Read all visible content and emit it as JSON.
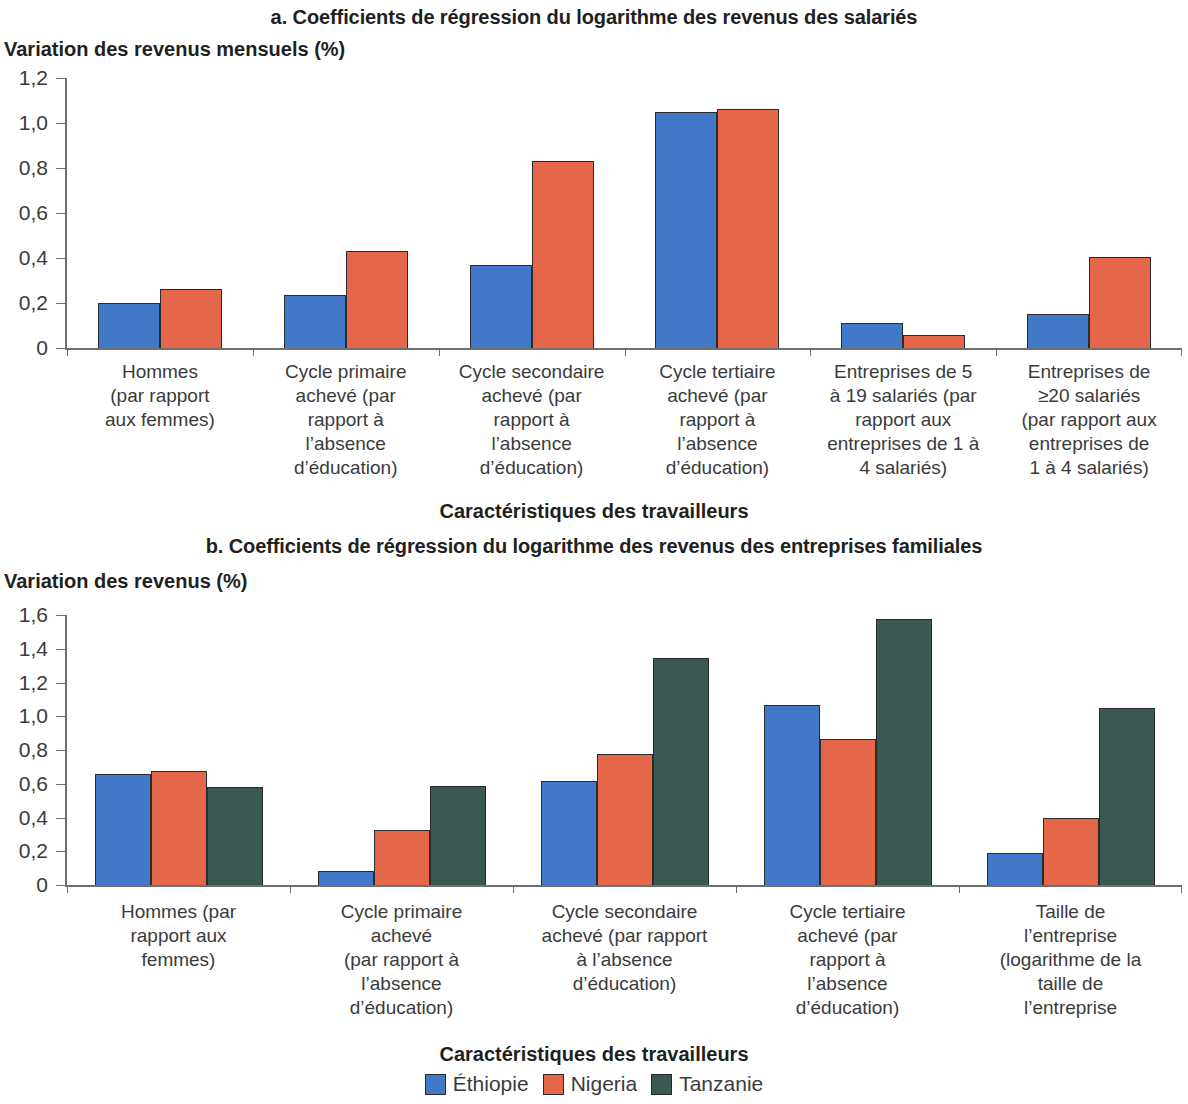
{
  "panel_a": {
    "title": "a. Coefficients de régression du logarithme des revenus des salariés",
    "ylabel": "Variation des revenus mensuels (%)",
    "xlabel": "Caractéristiques des travailleurs"
  },
  "panel_b": {
    "title": "b. Coefficients de régression du logarithme des revenus des entreprises familiales",
    "ylabel": "Variation des revenus (%)",
    "xlabel": "Caractéristiques des travailleurs"
  },
  "legend": {
    "items": [
      {
        "label": "Éthiopie",
        "color": "#4179c8"
      },
      {
        "label": "Nigeria",
        "color": "#e4674a"
      },
      {
        "label": "Tanzanie",
        "color": "#3a5952"
      }
    ]
  },
  "colors": {
    "ethiopie": "#4179c8",
    "nigeria": "#e4674a",
    "tanzanie": "#3a5952",
    "axis": "#6f6f6f",
    "text": "#3b3b3b",
    "bar_outline": "#2b2b2b"
  },
  "chart_data": [
    {
      "type": "bar",
      "title": "a. Coefficients de régression du logarithme des revenus des salariés",
      "ylabel": "Variation des revenus mensuels (%)",
      "xlabel": "Caractéristiques des travailleurs",
      "ylim": [
        0,
        1.2
      ],
      "yticks": [
        "0",
        "0,2",
        "0,4",
        "0,6",
        "0,8",
        "1,0",
        "1,2"
      ],
      "ytick_values": [
        0,
        0.2,
        0.4,
        0.6,
        0.8,
        1.0,
        1.2
      ],
      "grid": false,
      "legend_position": "bottom",
      "categories": [
        "Hommes\n(par rapport\naux femmes)",
        "Cycle primaire\nachevé (par\nrapport à\nl’absence\nd’éducation)",
        "Cycle secondaire\nachevé (par\nrapport à\nl’absence\nd’éducation)",
        "Cycle tertiaire\nachevé (par\nrapport à\nl’absence\nd’éducation)",
        "Entreprises de 5\nà 19 salariés (par\nrapport aux\nentreprises de 1 à\n4 salariés)",
        "Entreprises de\n≥20 salariés\n(par rapport aux\nentreprises de\n1 à 4 salariés)"
      ],
      "series": [
        {
          "name": "Éthiopie",
          "color": "#4179c8",
          "values": [
            0.21,
            0.245,
            0.38,
            1.06,
            0.12,
            0.16
          ]
        },
        {
          "name": "Nigeria",
          "color": "#e4674a",
          "values": [
            0.27,
            0.44,
            0.84,
            1.07,
            0.065,
            0.415
          ]
        }
      ]
    },
    {
      "type": "bar",
      "title": "b. Coefficients de régression du logarithme des revenus des entreprises familiales",
      "ylabel": "Variation des revenus (%)",
      "xlabel": "Caractéristiques des travailleurs",
      "ylim": [
        0,
        1.6
      ],
      "yticks": [
        "0",
        "0,2",
        "0,4",
        "0,6",
        "0,8",
        "1,0",
        "1,2",
        "1,4",
        "1,6"
      ],
      "ytick_values": [
        0,
        0.2,
        0.4,
        0.6,
        0.8,
        1.0,
        1.2,
        1.4,
        1.6
      ],
      "grid": false,
      "legend_position": "bottom",
      "categories": [
        "Hommes (par\nrapport aux\nfemmes)",
        "Cycle primaire\nachevé\n(par rapport à\nl’absence\nd’éducation)",
        "Cycle secondaire\nachevé (par rapport\nà l’absence\nd’éducation)",
        "Cycle tertiaire\nachevé (par\nrapport à\nl’absence\nd’éducation)",
        "Taille de\nl’entreprise\n(logarithme de la\ntaille de\nl’entreprise"
      ],
      "series": [
        {
          "name": "Éthiopie",
          "color": "#4179c8",
          "values": [
            0.67,
            0.095,
            0.63,
            1.08,
            0.2
          ]
        },
        {
          "name": "Nigeria",
          "color": "#e4674a",
          "values": [
            0.69,
            0.34,
            0.79,
            0.88,
            0.41
          ]
        },
        {
          "name": "Tanzanie",
          "color": "#3a5952",
          "values": [
            0.59,
            0.6,
            1.355,
            1.59,
            1.06
          ]
        }
      ]
    }
  ]
}
